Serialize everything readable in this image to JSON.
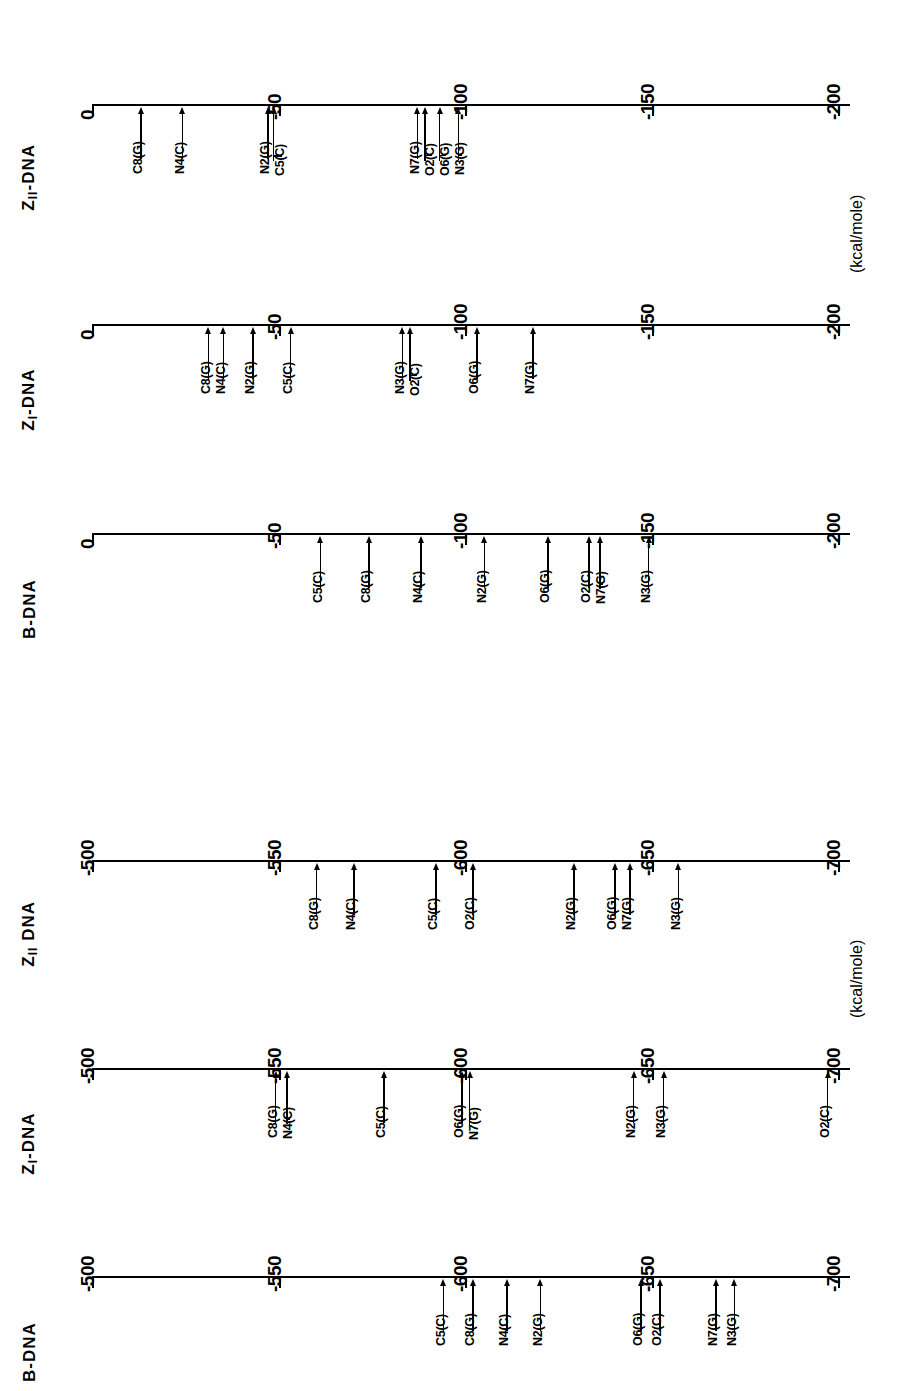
{
  "figure": {
    "orientation": "rotated-90-ccw",
    "unit_label": "(kcal/mole)",
    "ink_color": "#000000",
    "background_color": "#ffffff"
  },
  "chart_data": {
    "type": "scatter",
    "title": "",
    "xlabel": "(kcal/mole)",
    "ylabel": "",
    "grid": false,
    "legend": "none",
    "groups": [
      {
        "name": "range-0-to-200",
        "unit_label": "(kcal/mole)",
        "axis_min": 0,
        "axis_max": -200,
        "ticks": [
          0,
          -50,
          -100,
          -150,
          -200
        ],
        "tick_labels": [
          "0",
          "-50",
          "-100",
          "-150",
          "-200"
        ],
        "panels": [
          {
            "id": "z2-dna-top",
            "title": "Z",
            "title_sub": "II",
            "title_rest": "-DNA",
            "title_full": "Z_II-DNA",
            "points": [
              {
                "label": "C8(G)",
                "value": -13
              },
              {
                "label": "N4(C)",
                "value": -24
              },
              {
                "label": "N2(G)",
                "value": -47
              },
              {
                "label": "C5(C)",
                "value": -48.5
              },
              {
                "label": "N7(G)",
                "value": -87
              },
              {
                "label": "O2(C)",
                "value": -89
              },
              {
                "label": "O6(G)",
                "value": -93
              },
              {
                "label": "N3(G)",
                "value": -98
              }
            ]
          },
          {
            "id": "z1-dna-top",
            "title": "Z",
            "title_sub": "I",
            "title_rest": "-DNA",
            "title_full": "Z_I-DNA",
            "points": [
              {
                "label": "C8(G)",
                "value": -31
              },
              {
                "label": "N4(C)",
                "value": -35
              },
              {
                "label": "N2(G)",
                "value": -43
              },
              {
                "label": "C5(C)",
                "value": -53
              },
              {
                "label": "N3(G)",
                "value": -83
              },
              {
                "label": "O2(C)",
                "value": -85
              },
              {
                "label": "O6(G)",
                "value": -103
              },
              {
                "label": "N7(G)",
                "value": -118
              }
            ]
          },
          {
            "id": "b-dna-top",
            "title": "B",
            "title_sub": "",
            "title_rest": "-DNA",
            "title_full": "B-DNA",
            "points": [
              {
                "label": "C5(C)",
                "value": -61
              },
              {
                "label": "C8(G)",
                "value": -74
              },
              {
                "label": "N4(C)",
                "value": -88
              },
              {
                "label": "N2(G)",
                "value": -105
              },
              {
                "label": "O6(G)",
                "value": -122
              },
              {
                "label": "O2(C)",
                "value": -133
              },
              {
                "label": "N7(G)",
                "value": -136
              },
              {
                "label": "N3(G)",
                "value": -149
              }
            ]
          }
        ]
      },
      {
        "name": "range-500-to-700",
        "unit_label": "(kcal/mole)",
        "axis_min": -500,
        "axis_max": -700,
        "ticks": [
          -500,
          -550,
          -600,
          -650,
          -700
        ],
        "tick_labels": [
          "-500",
          "-550",
          "-600",
          "-650",
          "-700"
        ],
        "panels": [
          {
            "id": "z2-dna-bottom",
            "title": "Z",
            "title_sub": "II",
            "title_rest": " DNA",
            "title_full": "Z_II DNA",
            "points": [
              {
                "label": "C8(G)",
                "value": -560
              },
              {
                "label": "N4(C)",
                "value": -570
              },
              {
                "label": "C5(C)",
                "value": -592
              },
              {
                "label": "O2(C)",
                "value": -602
              },
              {
                "label": "N2(G)",
                "value": -629
              },
              {
                "label": "O6(G)",
                "value": -640
              },
              {
                "label": "N7(G)",
                "value": -644
              },
              {
                "label": "N3(G)",
                "value": -657
              }
            ]
          },
          {
            "id": "z1-dna-bottom",
            "title": "Z",
            "title_sub": "I",
            "title_rest": "-DNA",
            "title_full": "Z_I-DNA",
            "points": [
              {
                "label": "C8(G)",
                "value": -549
              },
              {
                "label": "N4(C)",
                "value": -552
              },
              {
                "label": "C5(C)",
                "value": -578
              },
              {
                "label": "O6(G)",
                "value": -599
              },
              {
                "label": "N7(G)",
                "value": -601
              },
              {
                "label": "N2(G)",
                "value": -645
              },
              {
                "label": "N3(G)",
                "value": -653
              },
              {
                "label": "O2(C)",
                "value": -697
              }
            ]
          },
          {
            "id": "b-dna-bottom",
            "title": "B",
            "title_sub": "",
            "title_rest": "-DNA",
            "title_full": "B-DNA",
            "points": [
              {
                "label": "C5(C)",
                "value": -594
              },
              {
                "label": "C8(G)",
                "value": -602
              },
              {
                "label": "N4(C)",
                "value": -611
              },
              {
                "label": "N2(G)",
                "value": -620
              },
              {
                "label": "O6(G)",
                "value": -647
              },
              {
                "label": "O2(C)",
                "value": -652
              },
              {
                "label": "N7(G)",
                "value": -667
              },
              {
                "label": "N3(G)",
                "value": -672
              }
            ]
          }
        ]
      }
    ]
  }
}
